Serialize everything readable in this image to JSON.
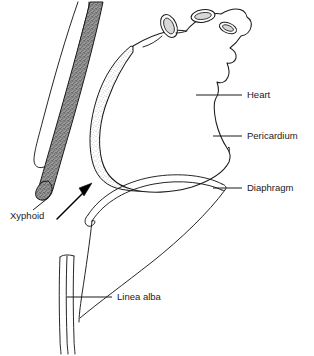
{
  "figure": {
    "background_color": "#ffffff",
    "line_color": "#1a1a1a",
    "width": 314,
    "height": 356
  },
  "labels": {
    "heart": "Heart",
    "pericardium": "Pericardium",
    "diaphragm": "Diaphragm",
    "xyphoid": "Xyphoid",
    "linea_alba": "Linea alba"
  },
  "structures": {
    "heart": {
      "name": "Heart",
      "fill": "#ffffff",
      "stroke": "#1a1a1a",
      "description": "Heart in sagittal profile with great vessel stumps at superior border"
    },
    "pericardium": {
      "name": "Pericardium",
      "fill": "#fbfbfb",
      "stipple_color": "#6e6e6e",
      "stroke": "#1a1a1a",
      "description": "Light stippled sac wrapping the inferior and left heart border"
    },
    "sternum": {
      "name": "Sternum with xyphoid process",
      "fill": "#8f8f8f",
      "stipple_color": "#4a4a4a",
      "stroke": "#1a1a1a",
      "description": "Dark stippled band descending to the rounded xyphoid tip"
    },
    "costal_cartilage": {
      "name": "Costal cartilage",
      "fill": "#ffffff",
      "stroke": "#1a1a1a",
      "description": "Narrow outlined rib cartilage strip left of the sternum"
    },
    "diaphragm": {
      "name": "Diaphragm",
      "stroke": "#1a1a1a",
      "description": "Thin double-line dome arc below the heart"
    },
    "abdominal_wall": {
      "name": "Abdominal wall",
      "stroke": "#1a1a1a",
      "description": "Long curve sweeping from the diaphragm down to the lower left"
    },
    "linea_alba": {
      "name": "Linea alba",
      "stroke": "#1a1a1a",
      "description": "Narrow triple-line vertical band in the lower left"
    },
    "needle_arrow": {
      "name": "Needle insertion arrow",
      "color": "#000000",
      "description": "Solid arrow angled up and to the right toward the subxyphoid space"
    }
  },
  "leaders": [
    {
      "label": "Heart",
      "target": "heart"
    },
    {
      "label": "Pericardium",
      "target": "pericardium"
    },
    {
      "label": "Diaphragm",
      "target": "diaphragm"
    },
    {
      "label": "Xyphoid",
      "target": "sternum"
    },
    {
      "label": "Linea alba",
      "target": "linea_alba"
    }
  ]
}
